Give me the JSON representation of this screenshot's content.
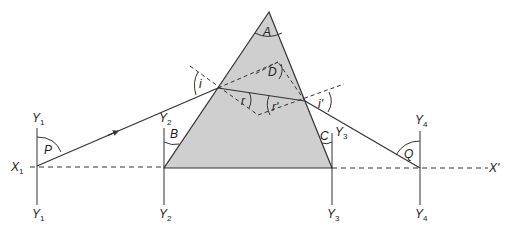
{
  "diagram": {
    "type": "prism-refraction",
    "colors": {
      "prism_fill": "#cfcfcf",
      "line": "#333333",
      "background": "#ffffff"
    },
    "angle_labels": {
      "apex": "A",
      "deviation": "D",
      "incidence": "i",
      "refraction": "r",
      "refraction_exit": "r'",
      "emergence": "i'",
      "P": "P",
      "B": "B",
      "C": "C",
      "Q": "Q"
    },
    "axis_labels": {
      "x_left": "X",
      "x_left_sub": "1",
      "x_right": "X'"
    },
    "verticals": [
      {
        "top": "Y",
        "top_sub": "1",
        "bottom": "Y",
        "bottom_sub": "1"
      },
      {
        "top": "Y",
        "top_sub": "2",
        "bottom": "Y",
        "bottom_sub": "2"
      },
      {
        "top": "Y",
        "top_sub": "3",
        "bottom": "Y",
        "bottom_sub": "3"
      },
      {
        "top": "Y",
        "top_sub": "4",
        "bottom": "Y",
        "bottom_sub": "4"
      }
    ]
  }
}
